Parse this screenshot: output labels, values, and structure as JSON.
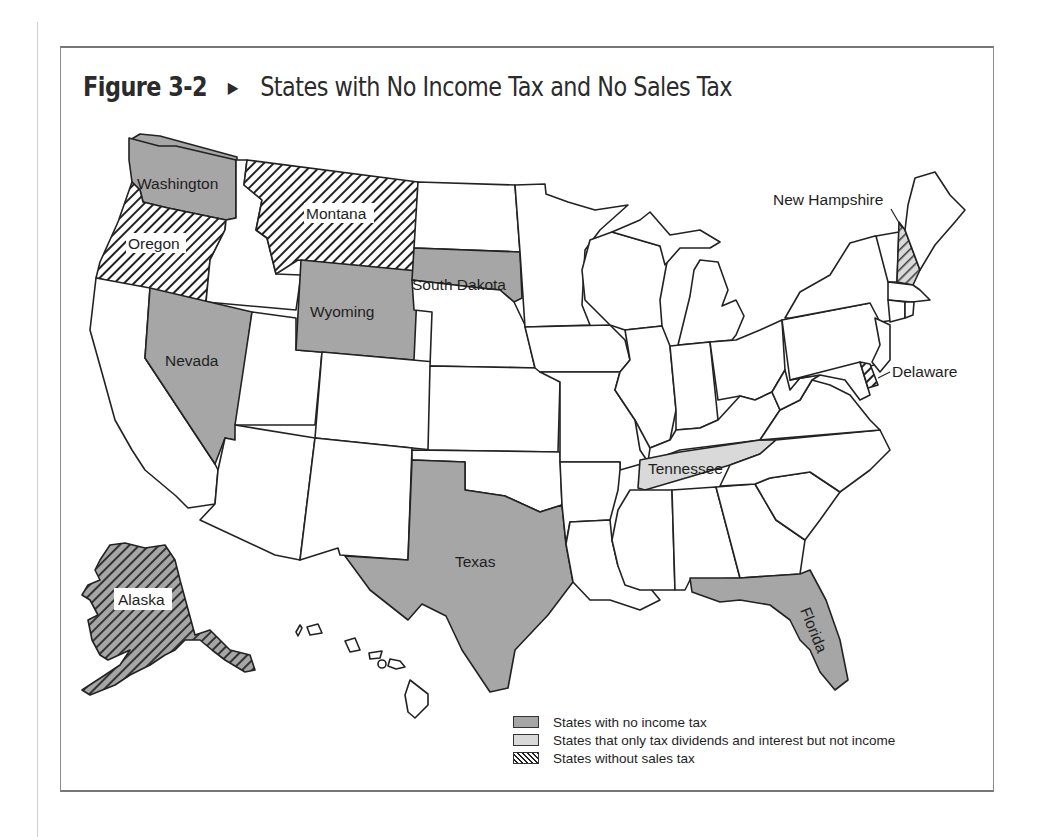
{
  "figure": {
    "number": "Figure 3-2",
    "arrow_icon": "▶",
    "title": "States with No Income Tax and No Sales Tax"
  },
  "map": {
    "labels": {
      "washington": "Washington",
      "oregon": "Oregon",
      "montana": "Montana",
      "wyoming": "Wyoming",
      "south_dakota": "South Dakota",
      "nevada": "Nevada",
      "texas": "Texas",
      "alaska": "Alaska",
      "florida": "Florida",
      "tennessee": "Tennessee",
      "new_hampshire": "New Hampshire",
      "delaware": "Delaware"
    },
    "categories": {
      "no_income_tax": [
        "Washington",
        "Nevada",
        "Wyoming",
        "South Dakota",
        "Texas",
        "Florida",
        "Alaska"
      ],
      "dividends_interest_only": [
        "Tennessee",
        "New Hampshire"
      ],
      "no_sales_tax": [
        "Oregon",
        "Montana",
        "Alaska",
        "New Hampshire",
        "Delaware"
      ]
    },
    "colors": {
      "no_income_tax": "#a6a6a6",
      "dividends_interest_only": "#d9d9d9",
      "no_sales_tax_hatch": "#222222",
      "outline": "#222222"
    }
  },
  "legend": {
    "items": [
      {
        "swatch": "gray",
        "label": "States with no income tax"
      },
      {
        "swatch": "light-gray",
        "label": "States that only tax dividends and interest but not income"
      },
      {
        "swatch": "hatched",
        "label": "States without sales tax"
      }
    ]
  }
}
